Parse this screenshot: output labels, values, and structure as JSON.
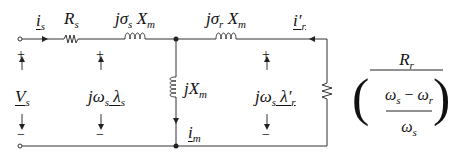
{
  "diagram": {
    "type": "equivalent-circuit",
    "labels": {
      "is": {
        "base": "i",
        "sub": "s"
      },
      "Rs": {
        "base": "R",
        "sub": "s"
      },
      "Lls": {
        "prefix": "jσ",
        "sub1": "s",
        "base": " X",
        "sub2": "m"
      },
      "Llr": {
        "prefix": "jσ",
        "sub1": "r",
        "base": " X",
        "sub2": "m"
      },
      "ir": {
        "base": "i′",
        "sub": "r"
      },
      "Vs": {
        "base": "V",
        "sub": "s"
      },
      "emf_s": {
        "prefix": "jω",
        "sub1": "s",
        "base": " λ",
        "sub2": "s"
      },
      "Xm": {
        "prefix": "jX",
        "sub": "m"
      },
      "emf_r": {
        "prefix": "jω",
        "sub1": "s",
        "base": " λ′",
        "sub2": "r"
      },
      "im": {
        "base": "i",
        "sub": "m"
      },
      "plus": "+",
      "minus": "−"
    },
    "load": {
      "numerator": {
        "base": "R",
        "sub": "r"
      },
      "denominator_top": {
        "a": "ω",
        "a_sub": "s",
        "op": " − ",
        "b": "ω",
        "b_sub": "r"
      },
      "denominator_bottom": {
        "base": "ω",
        "sub": "s"
      },
      "left_paren": "(",
      "right_paren": ")"
    }
  }
}
